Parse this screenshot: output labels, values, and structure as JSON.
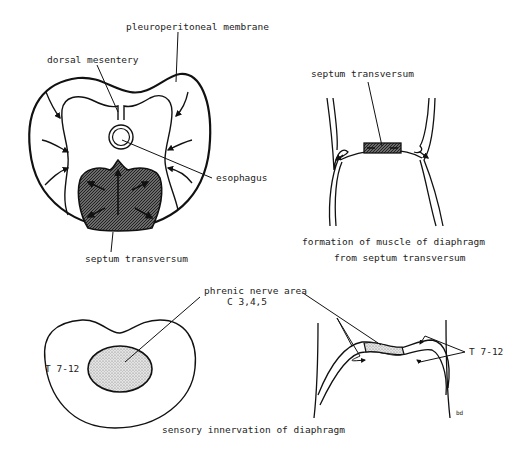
{
  "figure": {
    "panels": [
      {
        "id": "embryo-cross-section",
        "labels": {
          "pleuroperitoneal": "pleuroperitoneal membrane",
          "dorsal_mesentery": "dorsal mesentery",
          "esophagus": "esophagus",
          "septum": "septum transversum"
        }
      },
      {
        "id": "muscle-formation",
        "labels": {
          "septum": "septum transversum"
        },
        "caption_line1": "formation of muscle of diaphragm",
        "caption_line2": "from septum transversum"
      },
      {
        "id": "sensory-innervation",
        "labels": {
          "phrenic_line1": "phrenic nerve area",
          "phrenic_line2": "C  3,4,5",
          "thoracic_left": "T  7-12",
          "thoracic_right": "T  7-12"
        },
        "caption": "sensory innervation of diaphragm"
      }
    ],
    "signature": "bd"
  },
  "colors": {
    "line": "#111111",
    "hatch_fill": "#555555",
    "stipple_fill": "#c8c8c8",
    "text": "#222222"
  }
}
